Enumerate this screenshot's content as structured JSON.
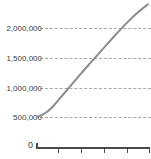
{
  "chart_data": {
    "type": "line",
    "title": "",
    "xlabel": "",
    "ylabel": "",
    "grid": true,
    "legend": false,
    "ylim": [
      0,
      2200000
    ],
    "y_ticks": [
      0,
      500000,
      1000000,
      1500000,
      2000000
    ],
    "y_tick_labels": [
      "0",
      "500,000",
      "1,000,000",
      "1,500,000",
      "2,000,000"
    ],
    "x_ticks": [
      0,
      1,
      2,
      3,
      4,
      5
    ],
    "x_tick_labels": [
      "",
      "",
      "",
      "",
      "",
      ""
    ],
    "series": [
      {
        "name": "series-1",
        "color": "#8c8c90",
        "x": [
          0.0,
          0.25,
          0.5,
          0.75,
          1.0,
          1.5,
          2.0,
          2.5,
          3.0,
          3.5,
          4.0,
          4.5,
          5.0
        ],
        "values": [
          500000,
          540000,
          600000,
          690000,
          800000,
          1020000,
          1240000,
          1450000,
          1660000,
          1870000,
          2070000,
          2250000,
          2400000
        ]
      }
    ]
  },
  "axes": {
    "y_labels": [
      {
        "text": "2,000,000",
        "value": 2000000
      },
      {
        "text": "1,500,000",
        "value": 1500000
      },
      {
        "text": "1,000,000",
        "value": 1000000
      },
      {
        "text": "500,000",
        "value": 500000
      }
    ],
    "zero_label": "0"
  },
  "fragments": {
    "top_clipped_text": "",
    "bottom_clipped_text": ""
  }
}
